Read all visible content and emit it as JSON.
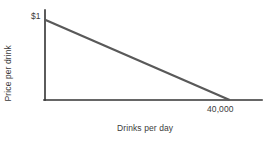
{
  "chart_data": {
    "type": "line",
    "title": "",
    "subtitle": "",
    "xlabel": "Drinks per day",
    "ylabel": "Price per drink",
    "xlim": [
      0,
      47000
    ],
    "ylim": [
      0,
      1
    ],
    "grid": false,
    "legend": null,
    "x_tick_labels": [
      "40,000"
    ],
    "x_tick_values": [
      40000
    ],
    "y_tick_labels": [
      "$1"
    ],
    "y_tick_values": [
      1
    ],
    "annotations": [
      {
        "name": "y-intercept-label",
        "text": "$1",
        "x": 0,
        "y": 1
      },
      {
        "name": "x-intercept-label",
        "text": "40,000",
        "x": 40000,
        "y": 0
      }
    ],
    "series": [
      {
        "name": "Demand",
        "type": "line",
        "color": "#595959",
        "linewidth": 2,
        "x": [
          0,
          40000
        ],
        "y": [
          1,
          0
        ],
        "points": [
          {
            "x": 0,
            "y": 1
          },
          {
            "x": 40000,
            "y": 0
          }
        ]
      }
    ]
  },
  "axes": {
    "axis_color": "#333333",
    "axis_linewidth": 1.5,
    "y_axis_top_value": 1.12,
    "x_axis_right_value": 47000
  },
  "style": {
    "background": "#ffffff",
    "text_color": "#3b3b3b",
    "line_color": "#595959",
    "axis_color": "#333333"
  }
}
